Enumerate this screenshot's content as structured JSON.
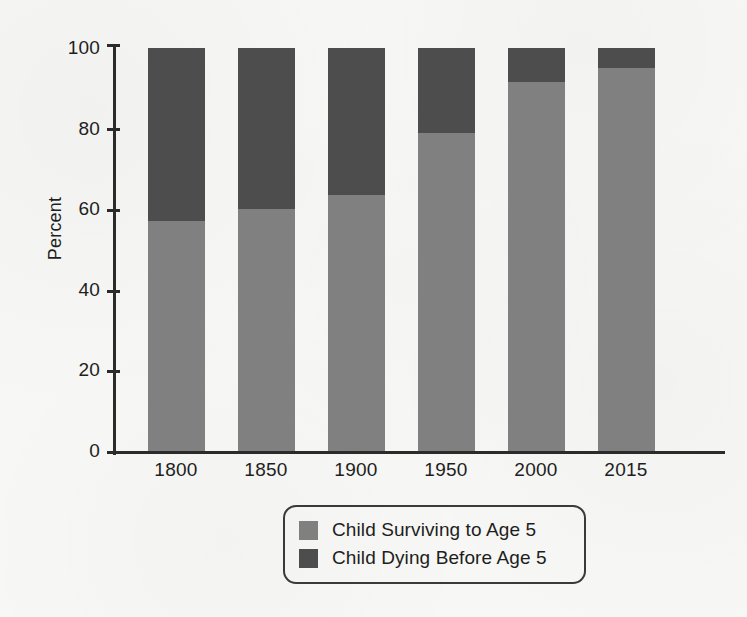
{
  "chart_data": {
    "type": "bar",
    "subtype": "stacked-vertical-100",
    "title": "",
    "xlabel": "",
    "ylabel": "Percent",
    "categories": [
      "1800",
      "1850",
      "1900",
      "1950",
      "2000",
      "2015"
    ],
    "series": [
      {
        "name": "Child Surviving to Age 5",
        "color": "#808080",
        "values": [
          57,
          60,
          63.5,
          79,
          91.5,
          95
        ]
      },
      {
        "name": "Child Dying Before Age 5",
        "color": "#4d4d4d",
        "values": [
          43,
          40,
          36.5,
          21,
          8.5,
          5
        ]
      }
    ],
    "ylim": [
      0,
      100
    ],
    "yticks": [
      0,
      20,
      40,
      60,
      80,
      100
    ],
    "ytick_labels": [
      "0",
      "20",
      "40",
      "60",
      "80",
      "100"
    ],
    "grid": false,
    "legend_position": "bottom-center",
    "legend_entries": [
      {
        "label": "Child Surviving to Age 5",
        "color": "#808080"
      },
      {
        "label": "Child Dying Before Age 5",
        "color": "#4d4d4d"
      }
    ]
  },
  "axes": {
    "y_title": "Percent",
    "y_ticks": [
      {
        "value": 100,
        "label": "100"
      },
      {
        "value": 80,
        "label": "80"
      },
      {
        "value": 60,
        "label": "60"
      },
      {
        "value": 40,
        "label": "40"
      },
      {
        "value": 20,
        "label": "20"
      },
      {
        "value": 0,
        "label": "0"
      }
    ],
    "x_ticks": [
      {
        "label": "1800"
      },
      {
        "label": "1850"
      },
      {
        "label": "1900"
      },
      {
        "label": "1950"
      },
      {
        "label": "2000"
      },
      {
        "label": "2015"
      }
    ]
  },
  "legend": {
    "entries": [
      {
        "label": "Child Surviving to Age 5",
        "color": "#808080"
      },
      {
        "label": "Child Dying Before Age 5",
        "color": "#4d4d4d"
      }
    ]
  },
  "colors": {
    "surviving": "#808080",
    "dying": "#4d4d4d",
    "axis": "#2b2b2b",
    "text": "#1e1e1e",
    "background": "#f7f7f5"
  }
}
